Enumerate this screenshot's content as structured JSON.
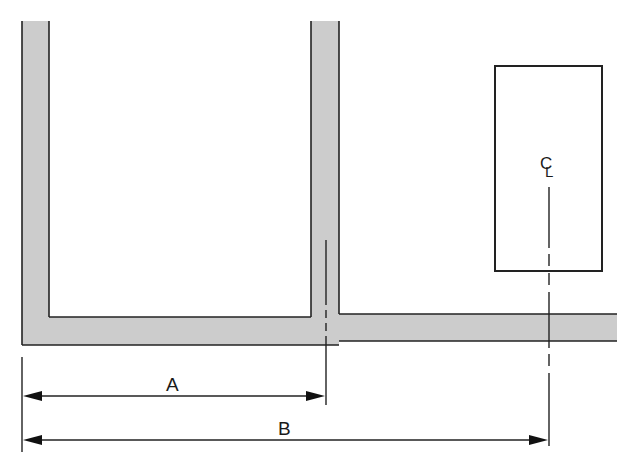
{
  "diagram": {
    "type": "dimension-drawing",
    "colors": {
      "wall_fill": "#cccccc",
      "line": "#222222",
      "background": "#ffffff"
    },
    "elements": {
      "left_wall": "wall",
      "middle_wall": "wall with centerline",
      "floor": "floor slab",
      "box": "rectangle with centerline"
    },
    "centerline_symbol": {
      "c": "C",
      "l": "L"
    },
    "dimensions": [
      {
        "label": "A",
        "from": "left outer edge of left wall",
        "to": "centerline of middle wall"
      },
      {
        "label": "B",
        "from": "left outer edge of left wall",
        "to": "centerline of rectangle"
      }
    ]
  }
}
